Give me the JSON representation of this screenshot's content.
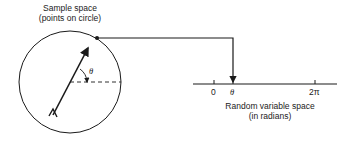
{
  "sample_space": {
    "title_line1": "Sample space",
    "title_line2": "(points on circle)",
    "angle_symbol": "θ"
  },
  "random_variable_space": {
    "title_line1": "Random variable space",
    "title_line2": "(in radians)",
    "ticks": [
      "0",
      "θ",
      "2π"
    ]
  },
  "colors": {
    "ink": "#1a1a1a",
    "background": "#ffffff"
  }
}
